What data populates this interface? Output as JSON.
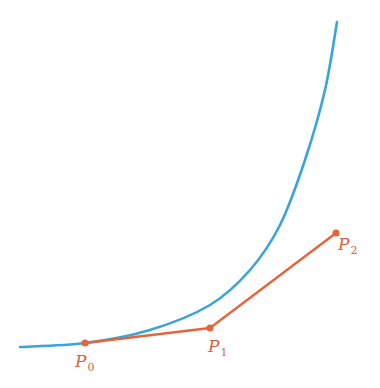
{
  "diagram": {
    "type": "bezier-tangent-illustration",
    "colors": {
      "curve": "#3aa3dc",
      "control": "#e5643a",
      "label": "#d9613c",
      "background": "#ffffff"
    },
    "curve": {
      "name": "blue-curve",
      "path_points": [
        [
          20,
          347
        ],
        [
          85,
          343
        ],
        [
          150,
          330
        ],
        [
          210,
          305
        ],
        [
          250,
          270
        ],
        [
          280,
          225
        ],
        [
          305,
          160
        ],
        [
          325,
          90
        ],
        [
          337,
          22
        ]
      ]
    },
    "control_polygon": {
      "points": [
        {
          "id": "P0",
          "x": 85,
          "y": 343,
          "label": "P",
          "subscript": "0",
          "label_x": 75,
          "label_y": 367
        },
        {
          "id": "P1",
          "x": 210,
          "y": 328,
          "label": "P",
          "subscript": "1",
          "label_x": 208,
          "label_y": 352
        },
        {
          "id": "P2",
          "x": 336,
          "y": 233,
          "label": "P",
          "subscript": "2",
          "label_x": 338,
          "label_y": 250
        }
      ]
    }
  }
}
